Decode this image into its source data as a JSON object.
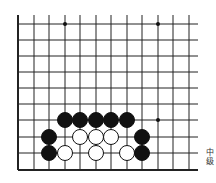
{
  "board": {
    "columns_x": [
      18,
      34,
      49,
      65,
      80,
      96,
      111,
      127,
      142,
      158,
      173,
      189
    ],
    "rows_y": [
      24,
      40,
      56,
      72,
      88,
      104,
      120,
      137,
      153,
      170
    ],
    "line_extend_top": 15,
    "line_extend_right": 198,
    "edges": [
      "left",
      "bottom"
    ],
    "star_points": [
      [
        65,
        24
      ],
      [
        158,
        24
      ],
      [
        158,
        120
      ]
    ],
    "stone_radius": 7.5,
    "stones": [
      {
        "color": "black",
        "x": 65,
        "y": 120
      },
      {
        "color": "black",
        "x": 80,
        "y": 120
      },
      {
        "color": "black",
        "x": 96,
        "y": 120
      },
      {
        "color": "black",
        "x": 111,
        "y": 120
      },
      {
        "color": "black",
        "x": 127,
        "y": 120
      },
      {
        "color": "black",
        "x": 49,
        "y": 137
      },
      {
        "color": "white",
        "x": 80,
        "y": 137
      },
      {
        "color": "white",
        "x": 96,
        "y": 137
      },
      {
        "color": "white",
        "x": 111,
        "y": 137
      },
      {
        "color": "black",
        "x": 142,
        "y": 137
      },
      {
        "color": "black",
        "x": 49,
        "y": 153
      },
      {
        "color": "white",
        "x": 65,
        "y": 153
      },
      {
        "color": "white",
        "x": 96,
        "y": 153
      },
      {
        "color": "white",
        "x": 127,
        "y": 153
      },
      {
        "color": "black",
        "x": 142,
        "y": 153
      }
    ]
  },
  "caption": {
    "line1": "中",
    "line2": "级"
  }
}
